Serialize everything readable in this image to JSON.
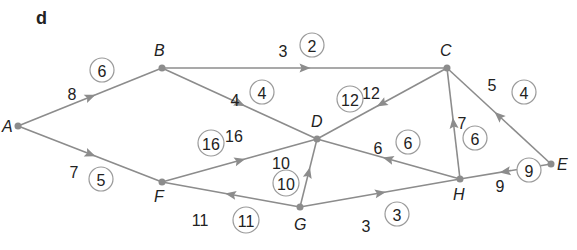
{
  "panel_label": "d",
  "colors": {
    "edge": "#8c8c8c",
    "text": "#222222",
    "ring": "#9a9a9a"
  },
  "nodes": [
    {
      "id": "A",
      "x": 18,
      "y": 126,
      "lx": 2,
      "ly": 132
    },
    {
      "id": "B",
      "x": 162,
      "y": 68,
      "lx": 154,
      "ly": 56
    },
    {
      "id": "C",
      "x": 447,
      "y": 68,
      "lx": 440,
      "ly": 56
    },
    {
      "id": "D",
      "x": 317,
      "y": 139,
      "lx": 311,
      "ly": 127
    },
    {
      "id": "E",
      "x": 551,
      "y": 164,
      "lx": 557,
      "ly": 170
    },
    {
      "id": "F",
      "x": 162,
      "y": 182,
      "lx": 154,
      "ly": 202
    },
    {
      "id": "G",
      "x": 300,
      "y": 207,
      "lx": 294,
      "ly": 230
    },
    {
      "id": "H",
      "x": 460,
      "y": 179,
      "lx": 453,
      "ly": 200
    }
  ],
  "edges": [
    {
      "from": "A",
      "to": "B",
      "capacity": "8",
      "flow": "6",
      "cx": 72,
      "cy": 94,
      "fx": 102,
      "fy": 70
    },
    {
      "from": "A",
      "to": "F",
      "capacity": "7",
      "flow": "5",
      "cx": 74,
      "cy": 172,
      "fx": 101,
      "fy": 179
    },
    {
      "from": "B",
      "to": "C",
      "capacity": "3",
      "flow": "2",
      "cx": 283,
      "cy": 51,
      "fx": 312,
      "fy": 45
    },
    {
      "from": "B",
      "to": "D",
      "capacity": "4",
      "flow": "4",
      "cx": 235,
      "cy": 100,
      "fx": 262,
      "fy": 92
    },
    {
      "from": "C",
      "to": "D",
      "capacity": "12",
      "flow": "12",
      "cx": 371,
      "cy": 93,
      "fx": 350,
      "fy": 99
    },
    {
      "from": "E",
      "to": "C",
      "capacity": "5",
      "flow": "4",
      "cx": 492,
      "cy": 85,
      "fx": 524,
      "fy": 92
    },
    {
      "from": "H",
      "to": "C",
      "capacity": "7",
      "flow": "6",
      "cx": 462,
      "cy": 123,
      "fx": 475,
      "fy": 138
    },
    {
      "from": "H",
      "to": "D",
      "capacity": "6",
      "flow": "6",
      "cx": 378,
      "cy": 148,
      "fx": 408,
      "fy": 142
    },
    {
      "from": "F",
      "to": "D",
      "capacity": "16",
      "flow": "16",
      "cx": 234,
      "cy": 136,
      "fx": 211,
      "fy": 143
    },
    {
      "from": "G",
      "to": "D",
      "capacity": "10",
      "flow": "10",
      "cx": 281,
      "cy": 163,
      "fx": 286,
      "fy": 183
    },
    {
      "from": "G",
      "to": "F",
      "capacity": "11",
      "flow": "11",
      "cx": 200,
      "cy": 220,
      "fx": 246,
      "fy": 220
    },
    {
      "from": "G",
      "to": "H",
      "capacity": "3",
      "flow": "3",
      "cx": 366,
      "cy": 226,
      "fx": 397,
      "fy": 214
    },
    {
      "from": "E",
      "to": "H",
      "capacity": "9",
      "flow": "9",
      "cx": 500,
      "cy": 186,
      "fx": 529,
      "fy": 170
    }
  ]
}
